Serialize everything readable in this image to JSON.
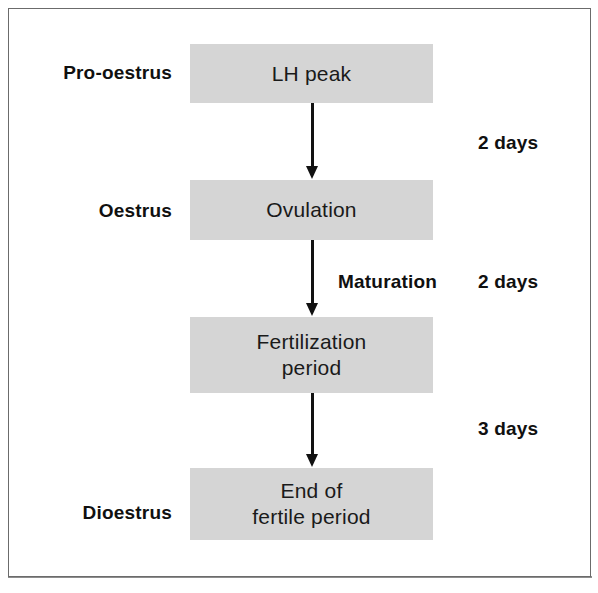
{
  "figure": {
    "type": "flow-diagram",
    "background_color": "#ffffff",
    "border_color": "#6b6b6b",
    "box_fill_color": "#d5d5d5",
    "text_color": "#101010",
    "arrow_color": "#111111"
  },
  "phase_labels": [
    {
      "id": "pro-oestrus",
      "text": "Pro-oestrus"
    },
    {
      "id": "oestrus",
      "text": "Oestrus"
    },
    {
      "id": "dioestrus",
      "text": "Dioestrus"
    }
  ],
  "stages": [
    {
      "id": "lh-peak",
      "line1": "LH peak",
      "line2": ""
    },
    {
      "id": "ovulation",
      "line1": "Ovulation",
      "line2": ""
    },
    {
      "id": "fertilization",
      "line1": "Fertilization",
      "line2": "period"
    },
    {
      "id": "end-fertile",
      "line1": "End of",
      "line2": "fertile period"
    }
  ],
  "durations": [
    {
      "id": "duration-1",
      "text": "2 days"
    },
    {
      "id": "duration-2",
      "text": "2 days"
    },
    {
      "id": "duration-3",
      "text": "3 days"
    }
  ],
  "annotations": {
    "maturation": "Maturation"
  }
}
